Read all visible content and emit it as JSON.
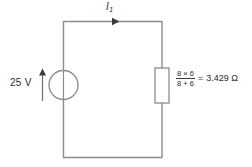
{
  "diagram": {
    "type": "electrical-circuit",
    "colors": {
      "background": "#ffffff",
      "wire": "#8c8c8c",
      "component_outline": "#8c8c8c",
      "text": "#2b2b2b",
      "arrow": "#3a3a3a"
    }
  },
  "source": {
    "label": "25 V",
    "value": 25,
    "unit": "V",
    "symbol": "circle",
    "polarity_arrow": "up"
  },
  "current": {
    "symbol": "I",
    "subscript": "1",
    "direction": "right"
  },
  "resistor": {
    "expression": {
      "numerator": "8 × 6",
      "denominator": "8 + 6"
    },
    "equals": "=",
    "result": "3.429 Ω",
    "value": 3.429,
    "unit": "Ω"
  }
}
